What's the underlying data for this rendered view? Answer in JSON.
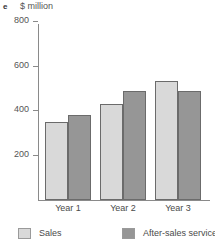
{
  "figure": {
    "panel_label": "e",
    "unit_title": "$ million"
  },
  "legend": {
    "items": [
      {
        "label": "Sales",
        "color": "#d9d9d9"
      },
      {
        "label": "After-sales service",
        "color": "#969696"
      }
    ]
  },
  "axis": {
    "y_ticks": [
      "200",
      "400",
      "600",
      "800"
    ],
    "x_categories": [
      "Year 1",
      "Year 2",
      "Year 3"
    ]
  },
  "chart_data": {
    "type": "bar",
    "title": "$ million",
    "xlabel": "",
    "ylabel": "$ million",
    "categories": [
      "Year 1",
      "Year 2",
      "Year 3"
    ],
    "series": [
      {
        "name": "Sales",
        "values": [
          350,
          430,
          535
        ],
        "color": "#d9d9d9"
      },
      {
        "name": "After-sales service",
        "values": [
          380,
          490,
          490
        ],
        "color": "#969696"
      }
    ],
    "ylim": [
      0,
      800
    ],
    "ytick_values": [
      200,
      400,
      600,
      800
    ],
    "grid": false,
    "legend_position": "bottom"
  }
}
